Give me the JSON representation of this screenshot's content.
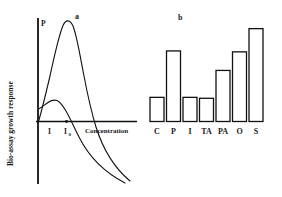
{
  "figure": {
    "panels": [
      {
        "id": "a",
        "label": "a",
        "type": "line",
        "ylabel": "Bio-assay growth response",
        "xlabel": "Concentration",
        "curve_label": "P",
        "xticks": [
          "I",
          "I"
        ],
        "xtick_subscripts": [
          "",
          "0"
        ]
      },
      {
        "id": "b",
        "label": "b",
        "type": "bar"
      }
    ]
  },
  "chart_data": [
    {
      "type": "line",
      "title": "a",
      "xlabel": "Concentration",
      "ylabel": "Bio-assay growth response",
      "grid": false,
      "legend": "none",
      "annotations": [
        "P",
        "I",
        "I0"
      ],
      "xlim": [
        0,
        100
      ],
      "ylim": [
        -60,
        100
      ],
      "series": [
        {
          "name": "P",
          "x": [
            0,
            4,
            9,
            14,
            18,
            22,
            25,
            27,
            30,
            34,
            38,
            42,
            46,
            50,
            55,
            62,
            70,
            80,
            90,
            100
          ],
          "y": [
            0,
            22,
            48,
            70,
            84,
            93,
            96,
            95,
            90,
            77,
            60,
            42,
            25,
            12,
            1,
            -12,
            -24,
            -36,
            -46,
            -54
          ]
        },
        {
          "name": "low-dose response",
          "x": [
            0,
            3,
            7,
            11,
            15,
            18,
            21,
            24,
            28,
            33,
            38,
            45,
            52,
            60,
            70,
            80,
            90,
            100
          ],
          "y": [
            12,
            16,
            21,
            25,
            27,
            27,
            25,
            21,
            14,
            4,
            -6,
            -18,
            -28,
            -37,
            -45,
            -51,
            -55,
            -58
          ]
        }
      ]
    },
    {
      "type": "bar",
      "title": "b",
      "xlabel": "",
      "ylabel": "",
      "grid": false,
      "legend": "none",
      "categories": [
        "C",
        "P",
        "I",
        "TA",
        "PA",
        "O",
        "S"
      ],
      "values": [
        26,
        76,
        26,
        25,
        55,
        75,
        100
      ],
      "ylim": [
        0,
        105
      ]
    }
  ]
}
